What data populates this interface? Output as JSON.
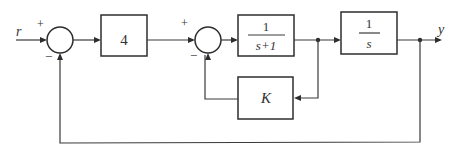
{
  "diagram": {
    "type": "block-diagram",
    "signals": {
      "input": "r",
      "output": "y"
    },
    "summing_junctions": [
      {
        "id": "sum1",
        "plus_sign": "+",
        "minus_sign": "−"
      },
      {
        "id": "sum2",
        "plus_sign": "+",
        "minus_sign": "−"
      }
    ],
    "blocks": [
      {
        "id": "gain4",
        "label": "4"
      },
      {
        "id": "plant1",
        "numerator": "1",
        "denominator": "s+1"
      },
      {
        "id": "integrator",
        "numerator": "1",
        "denominator": "s"
      },
      {
        "id": "feedbackK",
        "label": "K"
      }
    ],
    "connections": [
      "r → sum1(+)",
      "sum1 → 4",
      "4 → sum2(+)",
      "sum2 → 1/(s+1)",
      "1/(s+1) → 1/s",
      "1/(s+1) output → K → sum2(−)",
      "1/s → y",
      "y → sum1(−)"
    ]
  }
}
